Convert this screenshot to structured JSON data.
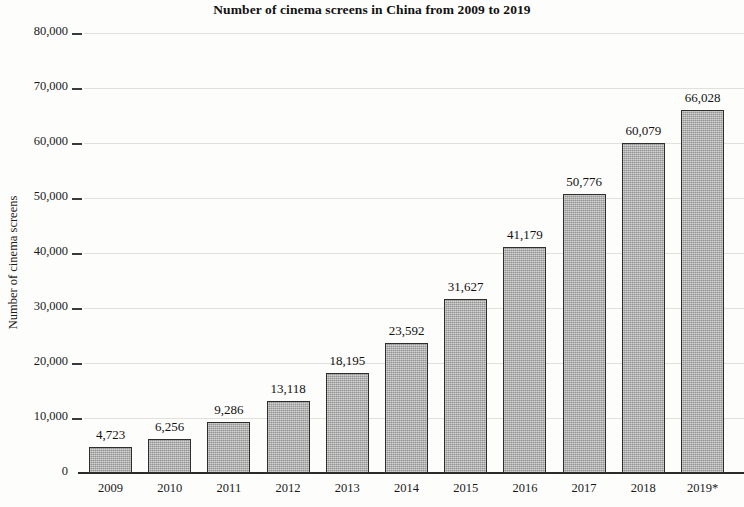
{
  "chart_data": {
    "type": "bar",
    "title": "Number of cinema screens in China from 2009 to 2019",
    "xlabel": "",
    "ylabel": "Number of cinema screens",
    "categories": [
      "2009",
      "2010",
      "2011",
      "2012",
      "2013",
      "2014",
      "2015",
      "2016",
      "2017",
      "2018",
      "2019*"
    ],
    "values": [
      4723,
      6256,
      9286,
      13118,
      18195,
      23592,
      31627,
      41179,
      50776,
      60079,
      66028
    ],
    "value_labels": [
      "4,723",
      "6,256",
      "9,286",
      "13,118",
      "18,195",
      "23,592",
      "31,627",
      "41,179",
      "50,776",
      "60,079",
      "66,028"
    ],
    "ylim": [
      0,
      80000
    ],
    "yticks": [
      0,
      10000,
      20000,
      30000,
      40000,
      50000,
      60000,
      70000,
      80000
    ],
    "ytick_labels": [
      "0",
      "10,000",
      "20,000",
      "30,000",
      "40,000",
      "50,000",
      "60,000",
      "70,000",
      "80,000"
    ],
    "grid": true,
    "legend": false,
    "bar_color": "#a9a9a9",
    "bar_border_color": "#2e2e2e",
    "gridline_color": "#d8d6d2",
    "axis_color": "#2a2a2a",
    "note": "2019 value marked with asterisk"
  }
}
